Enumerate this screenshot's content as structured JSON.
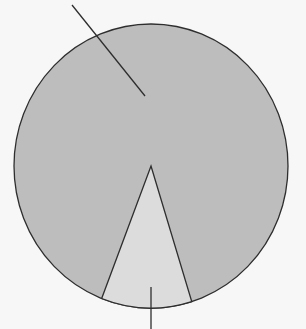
{
  "chart_data": {
    "type": "pie",
    "title": "",
    "labels": [
      "Slice A",
      "Slice B"
    ],
    "values": [
      89.5,
      10.5
    ],
    "colors": [
      "#bdbdbd",
      "#dcdcdc"
    ],
    "stroke_color": "#2e2e2e",
    "background": "#f7f7f7",
    "legend": "none",
    "annotations": [
      {
        "target": "Slice A",
        "type": "leader-line",
        "text": ""
      },
      {
        "target": "Slice B",
        "type": "leader-line",
        "text": ""
      }
    ],
    "geometry": {
      "cx": 151,
      "cy": 166,
      "rx": 137,
      "ry": 142,
      "small_slice_start_deg": 162.7,
      "small_slice_end_deg": 201.1
    }
  }
}
